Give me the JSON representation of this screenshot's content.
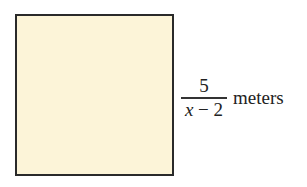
{
  "figure": {
    "shape": "square",
    "fill_color": "#fcf4d8",
    "border_color": "#2a2a2a",
    "side_label": {
      "numerator": "5",
      "denominator_var": "x",
      "denominator_rest": " − 2",
      "unit": "meters"
    }
  }
}
